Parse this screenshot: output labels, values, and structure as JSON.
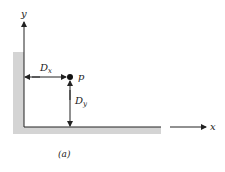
{
  "figure": {
    "caption": "(a)",
    "axes": {
      "y_label": "y",
      "x_label": "x"
    },
    "point": {
      "label": "p"
    },
    "dimensions": {
      "horizontal": {
        "label": "D",
        "subscript": "x"
      },
      "vertical": {
        "label": "D",
        "subscript": "y"
      }
    },
    "colors": {
      "wall_fill": "#d4d4d4",
      "line": "#222222"
    }
  }
}
